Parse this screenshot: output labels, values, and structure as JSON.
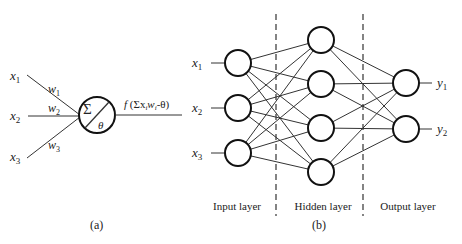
{
  "panel_a": {
    "caption": "(a)",
    "inputs": [
      {
        "label": "x",
        "sub": "1",
        "weight": "w",
        "wsub": "1"
      },
      {
        "label": "x",
        "sub": "2",
        "weight": "w",
        "wsub": "2"
      },
      {
        "label": "x",
        "sub": "3",
        "weight": "w",
        "wsub": "3"
      }
    ],
    "neuron": {
      "sum_symbol": "Σ",
      "threshold_symbol": "θ"
    },
    "output_label": {
      "f": "f",
      "open": " (Σx",
      "i1": "i",
      "w": "w",
      "i2": "i",
      "rest": "-θ)"
    }
  },
  "panel_b": {
    "caption": "(b)",
    "layers": {
      "input": {
        "label": "Input layer",
        "nodes": [
          "x1",
          "x2",
          "x3"
        ]
      },
      "hidden": {
        "label": "Hidden layer",
        "count": 4
      },
      "output": {
        "label": "Output layer",
        "nodes": [
          "y1",
          "y2"
        ]
      }
    },
    "input_labels": [
      {
        "label": "x",
        "sub": "1"
      },
      {
        "label": "x",
        "sub": "2"
      },
      {
        "label": "x",
        "sub": "3"
      }
    ],
    "output_labels": [
      {
        "label": "y",
        "sub": "1"
      },
      {
        "label": "y",
        "sub": "2"
      }
    ]
  }
}
